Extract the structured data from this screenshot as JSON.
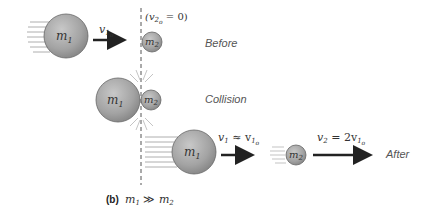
{
  "diagram": {
    "stages": {
      "before": {
        "label": "Before",
        "v1_label": "v",
        "v1_sub": "1",
        "v1_subsub": "o",
        "v2_note": "(v",
        "v2_note_sub": "2",
        "v2_note_subsub": "o",
        "v2_note_tail": " = 0)"
      },
      "collision": {
        "label": "Collision"
      },
      "after": {
        "label": "After",
        "v1_label": "v",
        "v1_sub": "1",
        "v1_eq": " ≈ v",
        "v1_eq_sub": "1",
        "v1_eq_subsub": "o",
        "v2_label": "v",
        "v2_sub": "2",
        "v2_eq": " = 2v",
        "v2_eq_sub": "1",
        "v2_eq_subsub": "o"
      }
    },
    "masses": {
      "m1": "m",
      "m1_sub": "1",
      "m2": "m",
      "m2_sub": "2"
    },
    "caption": {
      "part": "(b)",
      "m1": "m",
      "m1_sub": "1",
      "relation": " ≫ ",
      "m2": "m",
      "m2_sub": "2"
    },
    "colors": {
      "ball_fill": "#a6a6a6",
      "ball_stroke": "#666666",
      "arrow": "#222222",
      "dashed_line": "#555555",
      "motion_lines": "#999999"
    }
  }
}
